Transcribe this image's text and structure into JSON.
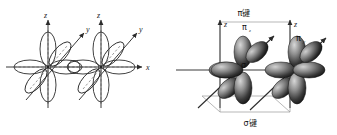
{
  "figure": {
    "title": "",
    "panels": [
      {
        "id": "left",
        "name": "outline-p-orbital-overlap-diagram",
        "description": "Two atoms with outlined p orbitals overlapping along the x axis",
        "atoms": [
          {
            "id": "atom-1",
            "cx": 48,
            "cy": 67
          },
          {
            "id": "atom-2",
            "cx": 101,
            "cy": 67
          }
        ],
        "axes": [
          {
            "name": "z",
            "label": "z",
            "atom": "atom-1"
          },
          {
            "name": "y",
            "label": "y",
            "atom": "atom-1"
          },
          {
            "name": "z",
            "label": "z",
            "atom": "atom-2"
          },
          {
            "name": "y",
            "label": "y",
            "atom": "atom-2"
          },
          {
            "name": "x",
            "label": "x",
            "atom": "shared"
          }
        ]
      },
      {
        "id": "right",
        "name": "shaded-p-orbital-bonding-diagram",
        "description": "Two atoms with shaded 3D p orbitals forming sigma and pi bonds",
        "atoms": [
          {
            "id": "atom-1",
            "cx": 75,
            "cy": 70
          },
          {
            "id": "atom-2",
            "cx": 129,
            "cy": 70
          }
        ],
        "axes": [
          {
            "name": "z",
            "label": "z",
            "atom": "atom-1"
          },
          {
            "name": "y",
            "label": "y",
            "atom": "atom-1"
          },
          {
            "name": "z",
            "label": "z",
            "atom": "atom-2"
          },
          {
            "name": "y",
            "label": "y",
            "atom": "atom-2"
          },
          {
            "name": "x",
            "label": "x",
            "atom": "shared"
          }
        ],
        "bond_labels": {
          "pi_top": "π键",
          "sigma_bottom": "σ键",
          "pi_z": "π",
          "pi_z_sub": "z",
          "pi_y": "π",
          "pi_y_sub": "y",
          "sigma_center": "σ"
        }
      }
    ],
    "colors": {
      "stroke": "#1a1a1a",
      "axis": "#4a4a4a",
      "lobe_outline": "#2b2b2b",
      "lobe_dark": "#1c1c1c",
      "lobe_mid": "#6e6e6e",
      "lobe_light": "#c9c9c9",
      "guide": "#8a8a8a",
      "background": "#ffffff"
    }
  }
}
